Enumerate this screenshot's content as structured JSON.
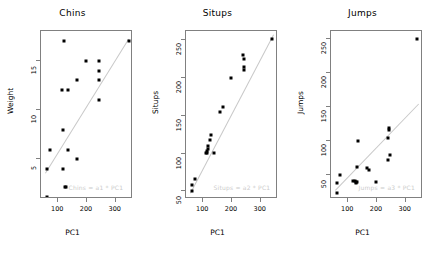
{
  "figure": {
    "width": 435,
    "height": 253,
    "background": "#ffffff",
    "point_color": "#000000",
    "line_color": "#c8c8c8",
    "frame_color": "#808080",
    "annotation_color": "#cccccc"
  },
  "chart_data": [
    {
      "type": "scatter",
      "title": "Chins",
      "xlabel": "PC1",
      "ylabel": "Weight",
      "xlim": [
        40,
        360
      ],
      "ylim": [
        1,
        18
      ],
      "xticks": [
        100,
        200,
        300
      ],
      "yticks": [
        5,
        10,
        15
      ],
      "grid": false,
      "legend": "none",
      "annotation": "Chins = a1 * PC1",
      "trendline": {
        "x": [
          55,
          345
        ],
        "y": [
          3.6,
          17.2
        ]
      },
      "points": [
        {
          "x": 120,
          "y": 17.0
        },
        {
          "x": 345,
          "y": 17.0
        },
        {
          "x": 196,
          "y": 15.0
        },
        {
          "x": 240,
          "y": 15.0
        },
        {
          "x": 240,
          "y": 14.0
        },
        {
          "x": 165,
          "y": 13.0
        },
        {
          "x": 240,
          "y": 13.0
        },
        {
          "x": 112,
          "y": 12.0
        },
        {
          "x": 133,
          "y": 12.0
        },
        {
          "x": 240,
          "y": 11.0
        },
        {
          "x": 115,
          "y": 8.0
        },
        {
          "x": 70,
          "y": 6.0
        },
        {
          "x": 133,
          "y": 6.0
        },
        {
          "x": 166,
          "y": 5.0
        },
        {
          "x": 60,
          "y": 4.0
        },
        {
          "x": 115,
          "y": 4.0
        },
        {
          "x": 122,
          "y": 2.2
        },
        {
          "x": 128,
          "y": 2.2
        },
        {
          "x": 60,
          "y": 1.2
        }
      ]
    },
    {
      "type": "scatter",
      "title": "Situps",
      "xlabel": "PC1",
      "ylabel": "Situps",
      "xlim": [
        40,
        360
      ],
      "ylim": [
        40,
        262
      ],
      "xticks": [
        100,
        200,
        300
      ],
      "yticks": [
        50,
        100,
        150,
        200,
        250
      ],
      "grid": false,
      "legend": "none",
      "annotation": "Situps = a2 * PC1",
      "trendline": {
        "x": [
          55,
          345
        ],
        "y": [
          48,
          258
        ]
      },
      "points": [
        {
          "x": 340,
          "y": 251
        },
        {
          "x": 238,
          "y": 230
        },
        {
          "x": 240,
          "y": 225
        },
        {
          "x": 242,
          "y": 215
        },
        {
          "x": 240,
          "y": 210
        },
        {
          "x": 196,
          "y": 200
        },
        {
          "x": 168,
          "y": 162
        },
        {
          "x": 158,
          "y": 155
        },
        {
          "x": 128,
          "y": 125
        },
        {
          "x": 122,
          "y": 118
        },
        {
          "x": 118,
          "y": 110
        },
        {
          "x": 116,
          "y": 106
        },
        {
          "x": 113,
          "y": 103
        },
        {
          "x": 112,
          "y": 101
        },
        {
          "x": 110,
          "y": 101
        },
        {
          "x": 136,
          "y": 101
        },
        {
          "x": 72,
          "y": 66
        },
        {
          "x": 62,
          "y": 58
        },
        {
          "x": 60,
          "y": 50
        }
      ]
    },
    {
      "type": "scatter",
      "title": "Jumps",
      "xlabel": "PC1",
      "ylabel": "Jumps",
      "xlim": [
        40,
        360
      ],
      "ylim": [
        15,
        262
      ],
      "xticks": [
        100,
        200,
        300
      ],
      "yticks": [
        50,
        100,
        150,
        200,
        250
      ],
      "grid": false,
      "legend": "none",
      "annotation": "Jumps = a3 * PC1",
      "trendline": {
        "x": [
          55,
          345
        ],
        "y": [
          28,
          155
        ]
      },
      "points": [
        {
          "x": 340,
          "y": 250
        },
        {
          "x": 240,
          "y": 120
        },
        {
          "x": 242,
          "y": 117
        },
        {
          "x": 238,
          "y": 105
        },
        {
          "x": 133,
          "y": 101
        },
        {
          "x": 244,
          "y": 80
        },
        {
          "x": 238,
          "y": 72
        },
        {
          "x": 130,
          "y": 62
        },
        {
          "x": 166,
          "y": 60
        },
        {
          "x": 172,
          "y": 58
        },
        {
          "x": 70,
          "y": 51
        },
        {
          "x": 116,
          "y": 42
        },
        {
          "x": 122,
          "y": 41
        },
        {
          "x": 128,
          "y": 40
        },
        {
          "x": 126,
          "y": 38
        },
        {
          "x": 132,
          "y": 40
        },
        {
          "x": 196,
          "y": 40
        },
        {
          "x": 62,
          "y": 38
        },
        {
          "x": 60,
          "y": 24
        }
      ]
    }
  ]
}
